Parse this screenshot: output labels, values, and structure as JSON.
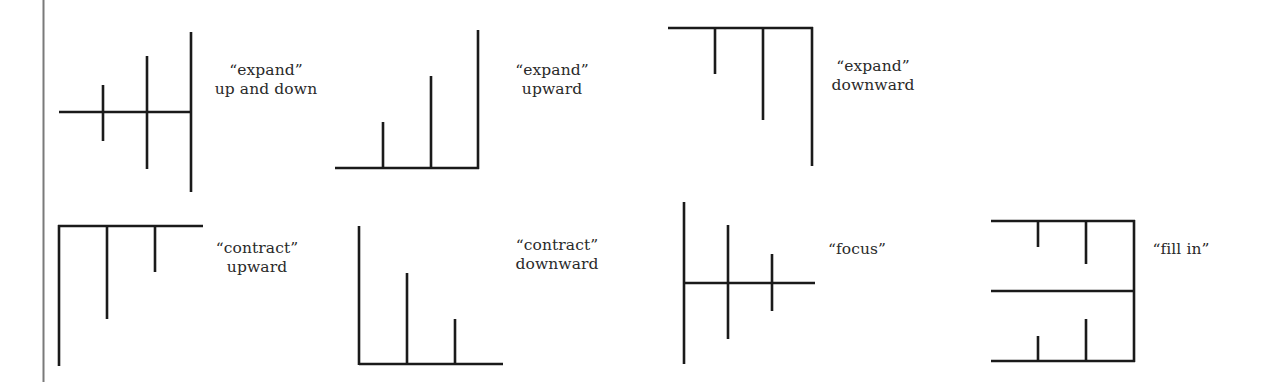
{
  "figure": {
    "border": {
      "x": 43.5,
      "y1": 0,
      "y2": 382,
      "color": "#7a7a7a"
    },
    "stroke_color": "#1a1a1a",
    "panels": [
      {
        "id": "expand-up-and-down",
        "label_lines": [
          "“expand”",
          "up and down"
        ],
        "label_pos": {
          "cx": 266,
          "top": 61
        },
        "lines": [
          [
            59,
            112,
            191,
            112
          ],
          [
            103,
            85,
            103,
            141
          ],
          [
            147,
            56,
            147,
            169
          ],
          [
            191,
            32,
            191,
            192
          ]
        ]
      },
      {
        "id": "expand-upward",
        "label_lines": [
          "“expand”",
          "upward"
        ],
        "label_pos": {
          "cx": 552,
          "top": 61
        },
        "lines": [
          [
            335,
            168,
            479,
            168
          ],
          [
            383,
            122,
            383,
            168
          ],
          [
            431,
            76,
            431,
            168
          ],
          [
            478,
            30,
            478,
            169
          ]
        ]
      },
      {
        "id": "expand-downward",
        "label_lines": [
          "“expand”",
          "downward"
        ],
        "label_pos": {
          "cx": 873,
          "top": 57
        },
        "lines": [
          [
            668,
            28,
            813,
            28
          ],
          [
            715,
            28,
            715,
            74
          ],
          [
            763,
            28,
            763,
            120
          ],
          [
            812,
            27,
            812,
            166
          ]
        ]
      },
      {
        "id": "contract-upward",
        "label_lines": [
          "“contract”",
          "upward"
        ],
        "label_pos": {
          "cx": 257,
          "top": 239
        },
        "lines": [
          [
            58,
            226,
            203,
            226
          ],
          [
            59,
            225,
            59,
            366
          ],
          [
            107,
            226,
            107,
            319
          ],
          [
            155,
            226,
            155,
            272
          ]
        ]
      },
      {
        "id": "contract-downward",
        "label_lines": [
          "“contract”",
          "downward"
        ],
        "label_pos": {
          "cx": 557,
          "top": 236
        },
        "lines": [
          [
            359,
            364,
            503,
            364
          ],
          [
            359,
            226,
            359,
            365
          ],
          [
            407,
            273,
            407,
            364
          ],
          [
            455,
            319,
            455,
            364
          ]
        ]
      },
      {
        "id": "focus",
        "label_lines": [
          "“focus”"
        ],
        "label_pos": {
          "cx": 857,
          "top": 240
        },
        "lines": [
          [
            684,
            202,
            684,
            364
          ],
          [
            684,
            283,
            815,
            283
          ],
          [
            728,
            225,
            728,
            339
          ],
          [
            772,
            254,
            772,
            311
          ]
        ]
      },
      {
        "id": "fill-in",
        "label_lines": [
          "“fill in”"
        ],
        "label_pos": {
          "cx": 1181,
          "top": 240
        },
        "lines": [
          [
            991,
            221,
            1135,
            221
          ],
          [
            991,
            291,
            1134,
            291
          ],
          [
            991,
            361,
            1135,
            361
          ],
          [
            1134,
            220,
            1134,
            362
          ],
          [
            1038,
            221,
            1038,
            247
          ],
          [
            1086,
            221,
            1086,
            264
          ],
          [
            1038,
            336,
            1038,
            361
          ],
          [
            1086,
            319,
            1086,
            361
          ]
        ]
      }
    ]
  }
}
